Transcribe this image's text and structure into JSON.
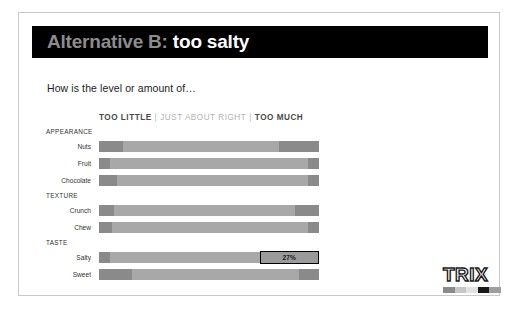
{
  "slide": {
    "title_strong": "Alternative B",
    "title_colon": ":",
    "title_rest": "too salty",
    "subtitle": "How is the level or amount of…"
  },
  "legend": {
    "too_little": "TOO LITTLE",
    "separator1": "|",
    "just_right": "JUST ABOUT RIGHT",
    "separator2": "|",
    "too_much": "TOO MUCH"
  },
  "logo": {
    "word": "TRIX",
    "swatches": [
      "#8a8a8a",
      "#c7c7c7",
      "#e2e2e2",
      "#1a1a1a",
      "#9e9e9e"
    ]
  },
  "colors": {
    "title_bar": "#000000",
    "title_strong": "#8c8c8c",
    "title_rest": "#ffffff",
    "segment_end": "#8a8a8a",
    "segment_middle": "#a8a8a8",
    "callout_border": "#000000",
    "legend_dark": "#4a4a4a",
    "legend_light": "#b3b3b3"
  },
  "chart_data": {
    "type": "bar",
    "subtype": "diverging-stacked-bar",
    "subtitle": "How is the level or amount of…",
    "xlabel": "",
    "ylabel": "",
    "xlim": [
      0,
      100
    ],
    "grid": false,
    "legend_position": "top",
    "series": [
      {
        "name": "TOO LITTLE",
        "color": "#8a8a8a"
      },
      {
        "name": "JUST ABOUT RIGHT",
        "color": "#a8a8a8"
      },
      {
        "name": "TOO MUCH",
        "color": "#8a8a8a"
      }
    ],
    "groups": [
      {
        "label": "APPEARANCE",
        "rows": [
          {
            "label": "Nuts",
            "too_little": 11,
            "just_right": 71,
            "too_much": 18,
            "highlight": false,
            "data_label": ""
          },
          {
            "label": "Fruit",
            "too_little": 5,
            "just_right": 90,
            "too_much": 5,
            "highlight": false,
            "data_label": ""
          },
          {
            "label": "Chocolate",
            "too_little": 8,
            "just_right": 87,
            "too_much": 5,
            "highlight": false,
            "data_label": ""
          }
        ]
      },
      {
        "label": "TEXTURE",
        "rows": [
          {
            "label": "Crunch",
            "too_little": 7,
            "just_right": 82,
            "too_much": 11,
            "highlight": false,
            "data_label": ""
          },
          {
            "label": "Chew",
            "too_little": 6,
            "just_right": 89,
            "too_much": 5,
            "highlight": false,
            "data_label": ""
          }
        ]
      },
      {
        "label": "TASTE",
        "rows": [
          {
            "label": "Salty",
            "too_little": 5,
            "just_right": 68,
            "too_much": 27,
            "highlight": true,
            "data_label": "27%"
          },
          {
            "label": "Sweet",
            "too_little": 15,
            "just_right": 76,
            "too_much": 9,
            "highlight": false,
            "data_label": ""
          }
        ]
      }
    ]
  }
}
